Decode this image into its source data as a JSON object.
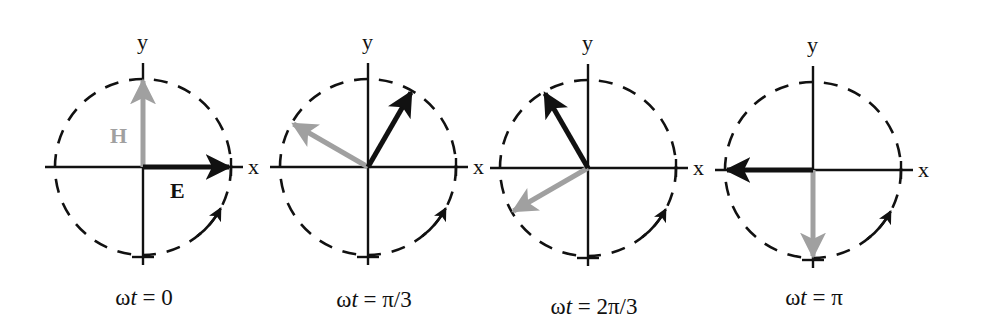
{
  "figure": {
    "colors": {
      "E": "#111111",
      "H": "#a0a0a0",
      "axes": "#111111"
    },
    "vector_labels": {
      "E": "E",
      "H": "H"
    },
    "axis_labels": {
      "x": "x",
      "y": "y"
    },
    "rotation_direction": "counter-clockwise",
    "panels": [
      {
        "caption_prefix": "ω",
        "caption_var": "t",
        "caption_rest": " = 0",
        "phase_deg": 0,
        "cx": 143,
        "cy": 167,
        "caption_x": 144,
        "caption_y": 305
      },
      {
        "caption_prefix": "ω",
        "caption_var": "t",
        "caption_rest": " = π/3",
        "phase_deg": 60,
        "cx": 368,
        "cy": 167,
        "caption_x": 374,
        "caption_y": 307
      },
      {
        "caption_prefix": "ω",
        "caption_var": "t",
        "caption_rest": " = 2π/3",
        "phase_deg": 120,
        "cx": 588,
        "cy": 168,
        "caption_x": 594,
        "caption_y": 314
      },
      {
        "caption_prefix": "ω",
        "caption_var": "t",
        "caption_rest": " = π",
        "phase_deg": 180,
        "cx": 813,
        "cy": 170,
        "caption_x": 814,
        "caption_y": 305
      }
    ]
  }
}
